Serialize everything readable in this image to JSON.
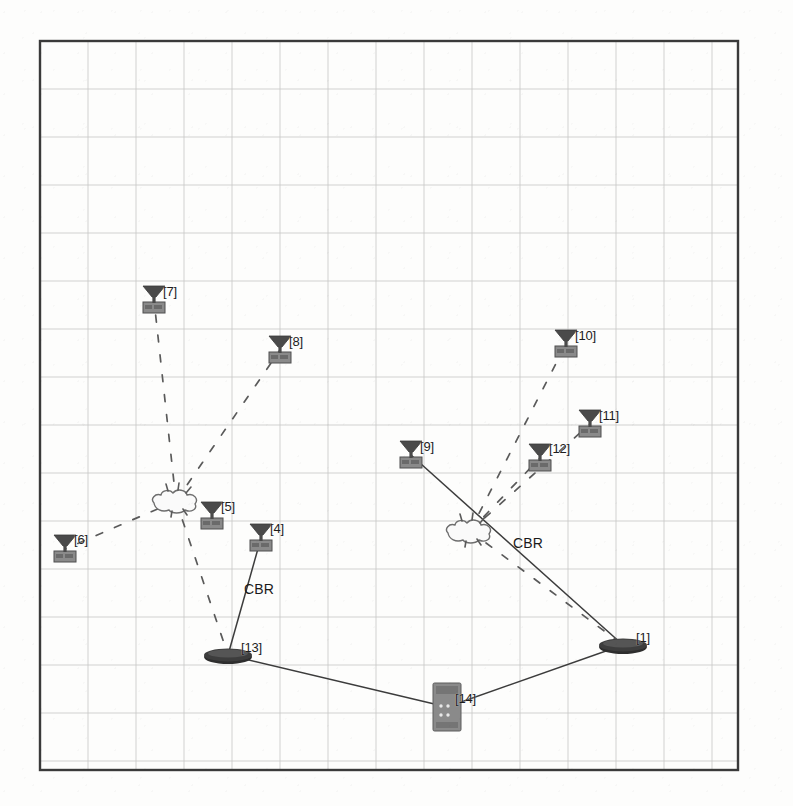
{
  "scene": {
    "title": "NAM wireless network animation",
    "background_color": "#fdfdfc",
    "border_color": "#3a3a3a",
    "grid_color": "#c9c9c9",
    "grid_spacing": 48,
    "border": {
      "x": 40,
      "y": 41,
      "width": 698,
      "height": 729
    }
  },
  "palette": {
    "node_dark": "#4a4a4a",
    "node_base": "#7b7b7b",
    "station_dark": "#2e2e2e",
    "server_gray": "#8a8a8a",
    "link_solid": "#3c3c3c",
    "link_dashed": "#5a5a5a",
    "label_color": "#1d1d1d"
  },
  "nodes": [
    {
      "id": "1",
      "label": "[1]",
      "type": "base-station",
      "x": 623,
      "y": 645,
      "label_x": 636,
      "label_y": 630
    },
    {
      "id": "4",
      "label": "[4]",
      "type": "wireless",
      "x": 261,
      "y": 538,
      "label_x": 270,
      "label_y": 521
    },
    {
      "id": "5",
      "label": "[5]",
      "type": "wireless",
      "x": 212,
      "y": 516,
      "label_x": 221,
      "label_y": 499
    },
    {
      "id": "6",
      "label": "[6]",
      "type": "wireless",
      "x": 65,
      "y": 549,
      "label_x": 74,
      "label_y": 532
    },
    {
      "id": "7",
      "label": "[7]",
      "type": "wireless",
      "x": 154,
      "y": 300,
      "label_x": 163,
      "label_y": 284
    },
    {
      "id": "8",
      "label": "[8]",
      "type": "wireless",
      "x": 280,
      "y": 350,
      "label_x": 289,
      "label_y": 334
    },
    {
      "id": "9",
      "label": "[9]",
      "type": "wireless",
      "x": 411,
      "y": 455,
      "label_x": 420,
      "label_y": 439
    },
    {
      "id": "10",
      "label": "[10]",
      "type": "wireless",
      "x": 566,
      "y": 344,
      "label_x": 575,
      "label_y": 328
    },
    {
      "id": "11",
      "label": "[11]",
      "type": "wireless",
      "x": 590,
      "y": 424,
      "label_x": 599,
      "label_y": 408
    },
    {
      "id": "12",
      "label": "[12]",
      "type": "wireless",
      "x": 540,
      "y": 458,
      "label_x": 549,
      "label_y": 441
    },
    {
      "id": "13",
      "label": "[13]",
      "type": "base-station",
      "x": 228,
      "y": 655,
      "label_x": 241,
      "label_y": 640
    },
    {
      "id": "14",
      "label": "[14]",
      "type": "server",
      "x": 447,
      "y": 707,
      "label_x": 455,
      "label_y": 691
    }
  ],
  "bursts": [
    {
      "name": "broadcast-burst-left",
      "x": 176,
      "y": 501
    },
    {
      "name": "broadcast-burst-right",
      "x": 470,
      "y": 531
    }
  ],
  "links": [
    {
      "from": "4",
      "to": "13",
      "style": "solid",
      "name": "link-4-13"
    },
    {
      "from": "9",
      "to": "1",
      "style": "solid",
      "name": "link-9-1"
    },
    {
      "from": "13",
      "to": "14",
      "style": "solid",
      "name": "link-13-14"
    },
    {
      "from": "14",
      "to": "1",
      "style": "solid",
      "name": "link-14-1"
    },
    {
      "from": "burst-left",
      "to": "7",
      "style": "dashed",
      "name": "wireless-link-7"
    },
    {
      "from": "burst-left",
      "to": "8",
      "style": "dashed",
      "name": "wireless-link-8"
    },
    {
      "from": "burst-left",
      "to": "6",
      "style": "dashed",
      "name": "wireless-link-6"
    },
    {
      "from": "burst-left",
      "to": "13",
      "style": "dashed",
      "name": "wireless-link-13"
    },
    {
      "from": "burst-right",
      "to": "10",
      "style": "dashed",
      "name": "wireless-link-10"
    },
    {
      "from": "burst-right",
      "to": "11",
      "style": "dashed",
      "name": "wireless-link-11"
    },
    {
      "from": "burst-right",
      "to": "12",
      "style": "dashed",
      "name": "wireless-link-12"
    },
    {
      "from": "burst-right",
      "to": "1",
      "style": "dashed",
      "name": "wireless-link-1"
    }
  ],
  "link_labels": [
    {
      "text": "CBR",
      "x": 244,
      "y": 581,
      "name": "cbr-label-left"
    },
    {
      "text": "CBR",
      "x": 513,
      "y": 535,
      "name": "cbr-label-right"
    }
  ]
}
